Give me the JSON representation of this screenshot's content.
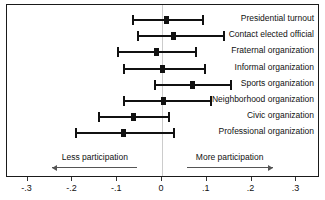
{
  "chart_data": {
    "type": "scatter",
    "title": "",
    "subtitle": "",
    "xlabel": "",
    "ylabel": "",
    "xlim": [
      -0.33,
      0.33
    ],
    "xticks": [
      -0.3,
      -0.2,
      -0.1,
      0,
      0.1,
      0.2,
      0.3
    ],
    "xtick_labels": [
      "-.3",
      "-.2",
      "-.1",
      "0",
      ".1",
      ".2",
      ".3"
    ],
    "grid": false,
    "legend": "none",
    "zero_reference_line": 0,
    "orientation": "horizontal",
    "categories": [
      "Presidential turnout",
      "Contact elected official",
      "Fraternal organization",
      "Informal organization",
      "Sports organization",
      "Neighborhood organization",
      "Civic organization",
      "Professional organization"
    ],
    "series": [
      {
        "name": "Point estimate",
        "values": [
          0.009,
          0.025,
          -0.013,
          0.0,
          0.069,
          0.004,
          -0.063,
          -0.087
        ]
      },
      {
        "name": "CI lower",
        "values": [
          -0.067,
          -0.056,
          -0.1,
          -0.087,
          -0.018,
          -0.087,
          -0.143,
          -0.194
        ]
      },
      {
        "name": "CI upper",
        "values": [
          0.092,
          0.138,
          0.076,
          0.096,
          0.154,
          0.109,
          0.016,
          0.027
        ]
      }
    ],
    "points": [
      {
        "label": "Presidential turnout",
        "estimate": 0.009,
        "low": -0.067,
        "high": 0.092
      },
      {
        "label": "Contact elected official",
        "estimate": 0.025,
        "low": -0.056,
        "high": 0.138
      },
      {
        "label": "Fraternal organization",
        "estimate": -0.013,
        "low": -0.1,
        "high": 0.076
      },
      {
        "label": "Informal organization",
        "estimate": 0.0,
        "low": -0.087,
        "high": 0.096
      },
      {
        "label": "Sports organization",
        "estimate": 0.069,
        "low": -0.018,
        "high": 0.154
      },
      {
        "label": "Neighborhood organization",
        "estimate": 0.004,
        "low": -0.087,
        "high": 0.109
      },
      {
        "label": "Civic organization",
        "estimate": -0.063,
        "low": -0.143,
        "high": 0.016
      },
      {
        "label": "Professional organization",
        "estimate": -0.087,
        "low": -0.194,
        "high": 0.027
      }
    ],
    "annotations": [
      {
        "text": "Less participation",
        "direction": "left",
        "from": -0.055,
        "to": -0.245
      },
      {
        "text": "More participation",
        "direction": "right",
        "from": 0.055,
        "to": 0.247
      }
    ]
  },
  "colors": {
    "marker": "#111111",
    "frame": "#1a1a1a",
    "zero_line": "#cccccc",
    "annotation_arrow": "#555555",
    "background": "#ffffff"
  }
}
